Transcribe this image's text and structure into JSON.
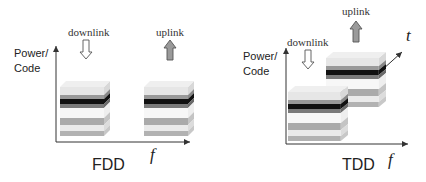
{
  "fdd": {
    "title": "FDD",
    "y_axis_label_line1": "Power/",
    "y_axis_label_line2": "Code",
    "x_axis_label": "f",
    "downlink_label": "downlink",
    "uplink_label": "uplink"
  },
  "tdd": {
    "title": "TDD",
    "y_axis_label_line1": "Power/",
    "y_axis_label_line2": "Code",
    "x_axis_label": "f",
    "depth_axis_label": "t",
    "downlink_label": "downlink",
    "uplink_label": "uplink"
  },
  "colors": {
    "axis": "#333333",
    "layer_light": "#e2e2e2",
    "layer_mid": "#a8a8a8",
    "layer_dark": "#7a7a7a",
    "layer_black": "#111111",
    "uplink_arrow_fill": "#9a9a9a"
  }
}
